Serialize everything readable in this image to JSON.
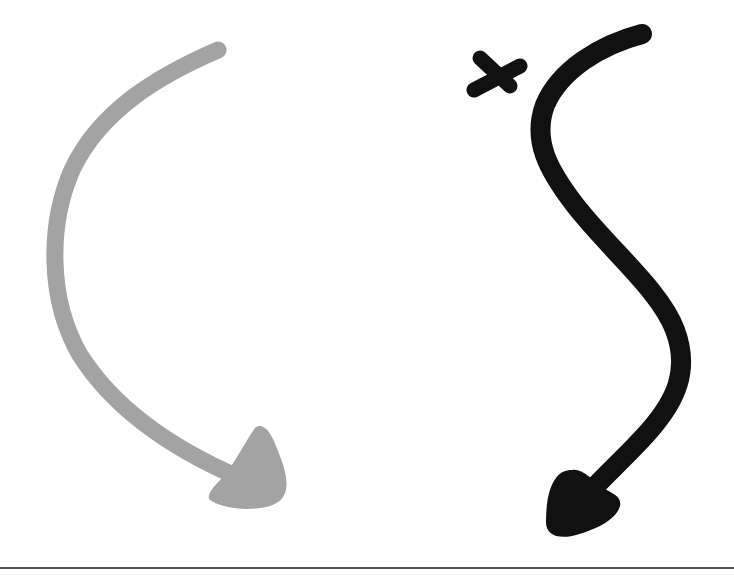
{
  "illustration": {
    "background": "#ffffff",
    "elements": [
      {
        "name": "gray-curved-arrow",
        "color": "#a3a3a3",
        "direction": "down-right"
      },
      {
        "name": "black-s-curve-arrow",
        "color": "#111111",
        "direction": "down-left"
      },
      {
        "name": "x-mark",
        "color": "#111111"
      },
      {
        "name": "bottom-rule",
        "color": "#555555"
      }
    ]
  }
}
